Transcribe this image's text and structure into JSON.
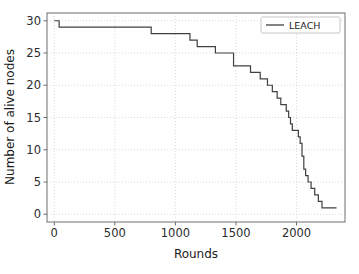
{
  "chart_data": {
    "type": "line",
    "title": "",
    "xlabel": "Rounds",
    "ylabel": "Number of alive nodes",
    "xlim": [
      -60,
      2400
    ],
    "ylim": [
      -1.2,
      31.2
    ],
    "xticks": [
      0,
      500,
      1000,
      1500,
      2000
    ],
    "yticks": [
      0,
      5,
      10,
      15,
      20,
      25,
      30
    ],
    "xtick_labels": [
      "0",
      "500",
      "1000",
      "1500",
      "2000"
    ],
    "ytick_labels": [
      "0",
      "5",
      "10",
      "15",
      "20",
      "25",
      "30"
    ],
    "grid": true,
    "grid_style": "dotted",
    "legend_position": "upper right",
    "drawstyle": "steps-post",
    "series": [
      {
        "name": "LEACH",
        "color": "#404040",
        "linewidth": 1.2,
        "x": [
          0,
          40,
          800,
          1120,
          1180,
          1240,
          1330,
          1430,
          1480,
          1520,
          1620,
          1700,
          1760,
          1800,
          1840,
          1870,
          1895,
          1915,
          1935,
          1950,
          1965,
          1985,
          2000,
          2015,
          2030,
          2045,
          2060,
          2075,
          2095,
          2120,
          2150,
          2180,
          2210,
          2250,
          2330
        ],
        "y": [
          30,
          29,
          28,
          27,
          26,
          26,
          25,
          25,
          23,
          23,
          22,
          21,
          20,
          19,
          18,
          17,
          17,
          16,
          15,
          14,
          13,
          13,
          13,
          12,
          11,
          9,
          7,
          6,
          5,
          4,
          3,
          2,
          1,
          1,
          1
        ]
      }
    ]
  },
  "legend": {
    "entries": [
      {
        "label": "LEACH",
        "color": "#404040"
      }
    ]
  },
  "axes": {
    "x_axis_label": "Rounds",
    "y_axis_label": "Number of alive nodes"
  },
  "colors": {
    "line": "#404040",
    "grid": "#d0d0d0",
    "frame": "#6e6e6e",
    "text": "#1a1a1a",
    "background": "#ffffff",
    "legend_border": "#b8b8b8"
  }
}
